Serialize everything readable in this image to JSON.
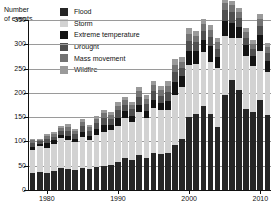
{
  "axis": {
    "ylabel": "Number\nof events",
    "xlabel": "",
    "yticks": [
      0,
      50,
      100,
      150,
      200,
      250,
      300,
      350
    ],
    "xticks": [
      1980,
      1990,
      2000,
      2010
    ],
    "ylim": [
      0,
      350
    ],
    "xlim": [
      1977.5,
      2011.5
    ]
  },
  "legend": {
    "position": "top-center",
    "items": [
      {
        "label": "Flood",
        "color": "#262626",
        "name": "flood"
      },
      {
        "label": "Storm",
        "color": "#d2d2d2",
        "name": "storm"
      },
      {
        "label": "Extreme temperature",
        "color": "#131313",
        "name": "extreme-temperature"
      },
      {
        "label": "Drought",
        "color": "#4f4f4f",
        "name": "drought"
      },
      {
        "label": "Mass movement",
        "color": "#737373",
        "name": "mass-movement"
      },
      {
        "label": "Wildfire",
        "color": "#9a9a9a",
        "name": "wildfire"
      }
    ]
  },
  "chart_data": {
    "type": "bar",
    "subtype": "stacked",
    "title": "",
    "xlabel": "",
    "ylabel": "Number of events",
    "ylim": [
      0,
      350
    ],
    "grid": true,
    "legend_position": "top-center",
    "categories": [
      1978,
      1979,
      1980,
      1981,
      1982,
      1983,
      1984,
      1985,
      1986,
      1987,
      1988,
      1989,
      1990,
      1991,
      1992,
      1993,
      1994,
      1995,
      1996,
      1997,
      1998,
      1999,
      2000,
      2001,
      2002,
      2003,
      2004,
      2005,
      2006,
      2007,
      2008,
      2009,
      2010,
      2011
    ],
    "series": [
      {
        "name": "Flood",
        "color": "#262626",
        "values": [
          35,
          38,
          36,
          40,
          46,
          44,
          42,
          46,
          44,
          48,
          50,
          52,
          58,
          66,
          62,
          72,
          66,
          76,
          74,
          76,
          92,
          106,
          150,
          156,
          172,
          156,
          130,
          196,
          226,
          206,
          166,
          160,
          186,
          154
        ]
      },
      {
        "name": "Storm",
        "color": "#d2d2d2",
        "values": [
          48,
          52,
          50,
          54,
          62,
          58,
          56,
          64,
          60,
          66,
          70,
          72,
          74,
          82,
          78,
          88,
          82,
          92,
          90,
          88,
          104,
          106,
          108,
          104,
          112,
          108,
          122,
          122,
          88,
          106,
          110,
          96,
          100,
          90
        ]
      },
      {
        "name": "Extreme temperature",
        "color": "#131313",
        "values": [
          6,
          4,
          10,
          8,
          6,
          10,
          8,
          10,
          8,
          12,
          14,
          10,
          16,
          14,
          12,
          16,
          14,
          18,
          16,
          20,
          26,
          22,
          28,
          26,
          24,
          32,
          22,
          30,
          30,
          24,
          22,
          20,
          34,
          22
        ]
      },
      {
        "name": "Drought",
        "color": "#4f4f4f",
        "values": [
          8,
          6,
          10,
          8,
          8,
          10,
          10,
          12,
          10,
          12,
          14,
          12,
          16,
          14,
          14,
          16,
          16,
          18,
          14,
          18,
          22,
          18,
          20,
          18,
          20,
          20,
          16,
          22,
          22,
          18,
          16,
          14,
          18,
          16
        ]
      },
      {
        "name": "Mass movement",
        "color": "#737373",
        "values": [
          6,
          4,
          6,
          6,
          6,
          8,
          6,
          8,
          8,
          8,
          10,
          8,
          10,
          10,
          10,
          12,
          10,
          12,
          12,
          12,
          14,
          12,
          16,
          14,
          14,
          14,
          14,
          16,
          14,
          12,
          12,
          10,
          14,
          12
        ]
      },
      {
        "name": "Wildfire",
        "color": "#9a9a9a",
        "values": [
          3,
          2,
          4,
          4,
          4,
          6,
          4,
          6,
          4,
          6,
          6,
          6,
          8,
          6,
          6,
          8,
          8,
          8,
          8,
          10,
          12,
          10,
          12,
          10,
          10,
          10,
          10,
          12,
          10,
          8,
          8,
          8,
          10,
          8
        ]
      }
    ]
  }
}
